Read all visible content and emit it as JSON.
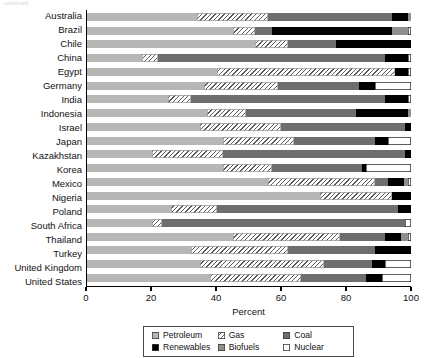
{
  "top_caption": "continued",
  "chart_data": {
    "type": "bar",
    "orientation": "horizontal",
    "stacked": true,
    "title": "",
    "xlabel": "Percent",
    "ylabel": "",
    "xlim": [
      0,
      100
    ],
    "xticks": [
      0,
      20,
      40,
      60,
      80,
      100
    ],
    "grid": false,
    "legend_position": "bottom",
    "categories": [
      "Australia",
      "Brazil",
      "Chile",
      "China",
      "Egypt",
      "Germany",
      "India",
      "Indonesia",
      "Israel",
      "Japan",
      "Kazakhstan",
      "Korea",
      "Mexico",
      "Nigeria",
      "Poland",
      "South Africa",
      "Thailand",
      "Turkey",
      "United Kingdom",
      "United States"
    ],
    "series": [
      {
        "name": "Petroleum",
        "color": "#b6b6b6",
        "values": [
          34,
          45,
          52,
          17,
          40,
          36,
          25,
          37,
          35,
          42,
          20,
          42,
          56,
          72,
          26,
          20,
          45,
          32,
          35,
          38
        ]
      },
      {
        "name": "Gas",
        "color": "#ffffff",
        "pattern": "diagonal-hatch",
        "values": [
          22,
          7,
          10,
          5,
          55,
          23,
          7,
          12,
          25,
          22,
          22,
          15,
          33,
          22,
          14,
          3,
          33,
          30,
          38,
          28
        ]
      },
      {
        "name": "Coal",
        "color": "#6e6e6e",
        "values": [
          38,
          5,
          15,
          70,
          0,
          25,
          60,
          34,
          38,
          25,
          56,
          28,
          4,
          0,
          56,
          75,
          14,
          27,
          15,
          20
        ]
      },
      {
        "name": "Renewables",
        "color": "#000000",
        "values": [
          5,
          37,
          23,
          7,
          4,
          5,
          7,
          16,
          2,
          4,
          2,
          1,
          5,
          6,
          4,
          0,
          5,
          11,
          4,
          5
        ]
      },
      {
        "name": "Biofuels",
        "color": "#8f8f8f",
        "values": [
          1,
          5,
          0,
          0,
          0,
          0,
          0,
          1,
          0,
          0,
          0,
          0,
          1,
          0,
          0,
          0,
          2,
          0,
          0,
          0
        ]
      },
      {
        "name": "Nuclear",
        "color": "#ffffff",
        "values": [
          0,
          1,
          0,
          1,
          1,
          11,
          1,
          0,
          0,
          7,
          0,
          14,
          1,
          0,
          0,
          2,
          1,
          0,
          8,
          9
        ]
      }
    ]
  },
  "legend": {
    "items": [
      {
        "label": "Petroleum",
        "key": "petroleum"
      },
      {
        "label": "Gas",
        "key": "gas"
      },
      {
        "label": "Coal",
        "key": "coal"
      },
      {
        "label": "Renewables",
        "key": "renewables"
      },
      {
        "label": "Biofuels",
        "key": "biofuels"
      },
      {
        "label": "Nuclear",
        "key": "nuclear"
      }
    ]
  }
}
